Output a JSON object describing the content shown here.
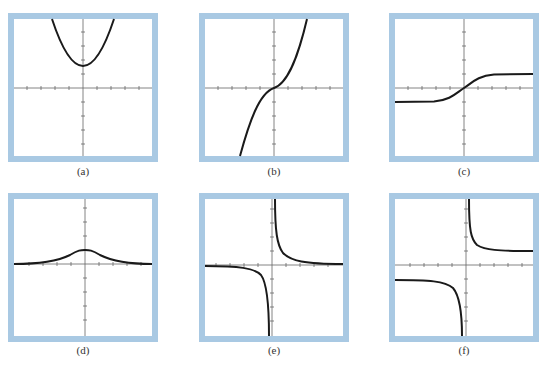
{
  "figure": {
    "border_color": "#a9c9e3",
    "curve_color": "#1a1a1a",
    "axis_color": "#555555",
    "ticks_per_half_axis": 4,
    "panels": [
      {
        "id": "a",
        "label": "(a)",
        "description": "Parabola opening upward with vertex above origin (positive y-intercept)"
      },
      {
        "id": "b",
        "label": "(b)",
        "description": "Increasing cubic-like curve through the origin with inflection at origin"
      },
      {
        "id": "c",
        "label": "(c)",
        "description": "Sigmoid / arctan-like curve with horizontal asymptotes at y = +1 and y = -1"
      },
      {
        "id": "d",
        "label": "(d)",
        "description": "Bell-shaped curve with peak at x = 0, approaching y = 0 on both sides"
      },
      {
        "id": "e",
        "label": "(e)",
        "description": "Reciprocal function y = 1/x with vertical asymptote x = 0 and horizontal asymptote y = 0"
      },
      {
        "id": "f",
        "label": "(f)",
        "description": "Shifted reciprocal with vertical asymptote x = 0, horizontal asymptotes y = +1 (right) and y = -1 (left)"
      }
    ]
  }
}
